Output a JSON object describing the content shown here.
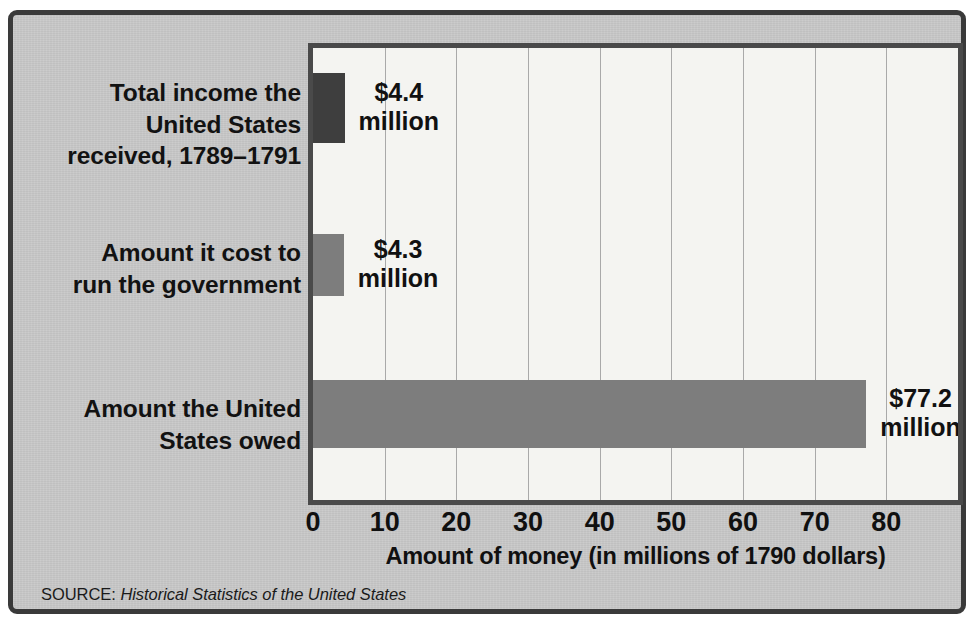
{
  "figure": {
    "background_color": "#c9c9c9",
    "frame_color": "#3a3a3a",
    "plot_background_color": "#f4f4f1",
    "plot_border_color": "#4a4a4a",
    "gridline_color": "#a9a9a9"
  },
  "source": {
    "label": "SOURCE:",
    "title": "Historical Statistics of the United States"
  },
  "chart_data": {
    "type": "bar",
    "orientation": "horizontal",
    "title": "",
    "xlabel": "Amount of money (in millions of 1790 dollars)",
    "ylabel": "",
    "xlim": [
      0,
      90
    ],
    "xticks": [
      0,
      10,
      20,
      30,
      40,
      50,
      60,
      70,
      80
    ],
    "xtick_labels": [
      "0",
      "10",
      "20",
      "30",
      "40",
      "50",
      "60",
      "70",
      "80"
    ],
    "grid": true,
    "grid_axis": "x",
    "legend": false,
    "categories": [
      "Total income the United States received, 1789–1791",
      "Amount it cost to run the government",
      "Amount the United States owed"
    ],
    "category_label_lines": [
      [
        "Total income the",
        "United States",
        "received, 1789–1791"
      ],
      [
        "Amount it cost to",
        "run the government"
      ],
      [
        "Amount the United",
        "States owed"
      ]
    ],
    "values": [
      4.4,
      4.3,
      77.2
    ],
    "value_labels": [
      {
        "amount": "$4.4",
        "unit": "million"
      },
      {
        "amount": "$4.3",
        "unit": "million"
      },
      {
        "amount": "$77.2",
        "unit": "million"
      }
    ],
    "bar_colors": [
      "#3e3e3e",
      "#7d7d7d",
      "#7d7d7d"
    ],
    "units": "millions of 1790 dollars"
  }
}
